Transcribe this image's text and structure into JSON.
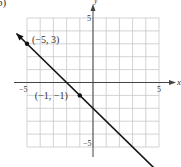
{
  "figure": {
    "part_label": "b)"
  },
  "chart_data": {
    "type": "line",
    "title": "",
    "xlabel": "x",
    "ylabel": "y",
    "xlim": [
      -5,
      5
    ],
    "ylim": [
      -5,
      5
    ],
    "grid": true,
    "x_ticks": [
      {
        "value": -5,
        "label": "−5"
      },
      {
        "value": 5,
        "label": "5"
      }
    ],
    "y_ticks": [
      {
        "value": 5,
        "label": "5"
      },
      {
        "value": -5,
        "label": "−5"
      }
    ],
    "series": [
      {
        "name": "y = -x - 2",
        "equation": "y = -x - 2",
        "slope": -1,
        "intercept": -2,
        "x": [
          -5.8,
          5.6
        ],
        "y": [
          3.8,
          -7.6
        ],
        "arrows": "both"
      }
    ],
    "points": [
      {
        "x": -5,
        "y": 3,
        "label": "(−5, 3)"
      },
      {
        "x": -1,
        "y": -1,
        "label": "(−1, −1)"
      }
    ]
  },
  "colors": {
    "grid": "#c8c8c8",
    "axis": "#444444",
    "line": "#111111",
    "text": "#333333"
  }
}
